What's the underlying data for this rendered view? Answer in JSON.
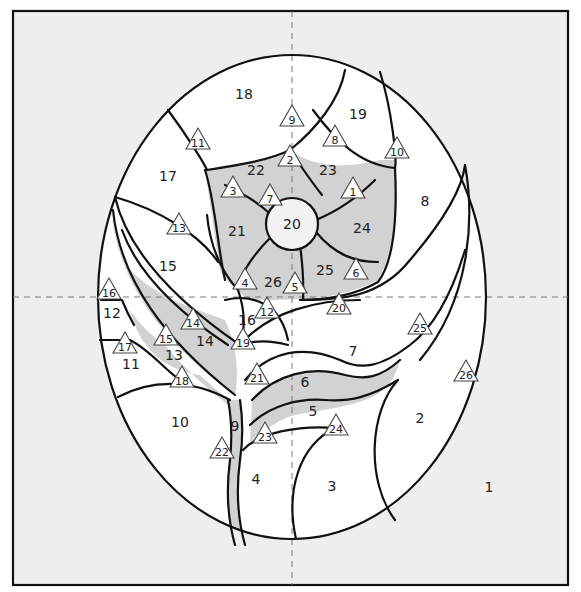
{
  "diagram": {
    "colors": {
      "background": "#eeeeee",
      "white_piece": "#ffffff",
      "gray_piece": "#d2d2d2",
      "center": "#f2f2f2",
      "outline": "#111111",
      "guide_line": "#777777"
    },
    "piece_labels": [
      {
        "text": "1",
        "x": 489,
        "y": 487
      },
      {
        "text": "2",
        "x": 420,
        "y": 418
      },
      {
        "text": "3",
        "x": 332,
        "y": 486
      },
      {
        "text": "4",
        "x": 256,
        "y": 479
      },
      {
        "text": "5",
        "x": 313,
        "y": 411
      },
      {
        "text": "6",
        "x": 305,
        "y": 382
      },
      {
        "text": "7",
        "x": 353,
        "y": 351
      },
      {
        "text": "8",
        "x": 425,
        "y": 201
      },
      {
        "text": "9",
        "x": 235,
        "y": 426
      },
      {
        "text": "10",
        "x": 180,
        "y": 422
      },
      {
        "text": "11",
        "x": 131,
        "y": 364
      },
      {
        "text": "12",
        "x": 112,
        "y": 313
      },
      {
        "text": "13",
        "x": 174,
        "y": 355
      },
      {
        "text": "14",
        "x": 205,
        "y": 341
      },
      {
        "text": "15",
        "x": 168,
        "y": 266
      },
      {
        "text": "16",
        "x": 247,
        "y": 320
      },
      {
        "text": "17",
        "x": 168,
        "y": 176
      },
      {
        "text": "18",
        "x": 244,
        "y": 94
      },
      {
        "text": "19",
        "x": 358,
        "y": 114
      },
      {
        "text": "20",
        "x": 292,
        "y": 224
      },
      {
        "text": "21",
        "x": 237,
        "y": 231
      },
      {
        "text": "22",
        "x": 256,
        "y": 170
      },
      {
        "text": "23",
        "x": 328,
        "y": 170
      },
      {
        "text": "24",
        "x": 362,
        "y": 228
      },
      {
        "text": "25",
        "x": 325,
        "y": 270
      },
      {
        "text": "26",
        "x": 273,
        "y": 282
      }
    ],
    "triangle_markers": [
      {
        "text": "1",
        "x": 353,
        "y": 189
      },
      {
        "text": "2",
        "x": 290,
        "y": 157
      },
      {
        "text": "3",
        "x": 233,
        "y": 188
      },
      {
        "text": "4",
        "x": 245,
        "y": 280
      },
      {
        "text": "5",
        "x": 295,
        "y": 284
      },
      {
        "text": "6",
        "x": 356,
        "y": 270
      },
      {
        "text": "7",
        "x": 270,
        "y": 196
      },
      {
        "text": "8",
        "x": 335,
        "y": 137
      },
      {
        "text": "9",
        "x": 292,
        "y": 117
      },
      {
        "text": "10",
        "x": 397,
        "y": 149
      },
      {
        "text": "11",
        "x": 198,
        "y": 140
      },
      {
        "text": "13",
        "x": 179,
        "y": 225
      },
      {
        "text": "12",
        "x": 267,
        "y": 309
      },
      {
        "text": "14",
        "x": 193,
        "y": 320
      },
      {
        "text": "15",
        "x": 166,
        "y": 336
      },
      {
        "text": "16",
        "x": 109,
        "y": 290
      },
      {
        "text": "17",
        "x": 125,
        "y": 344
      },
      {
        "text": "18",
        "x": 182,
        "y": 378
      },
      {
        "text": "19",
        "x": 243,
        "y": 340
      },
      {
        "text": "20",
        "x": 339,
        "y": 305
      },
      {
        "text": "21",
        "x": 257,
        "y": 375
      },
      {
        "text": "22",
        "x": 222,
        "y": 449
      },
      {
        "text": "23",
        "x": 265,
        "y": 434
      },
      {
        "text": "24",
        "x": 336,
        "y": 426
      },
      {
        "text": "25",
        "x": 420,
        "y": 325
      },
      {
        "text": "26",
        "x": 466,
        "y": 372
      }
    ]
  }
}
